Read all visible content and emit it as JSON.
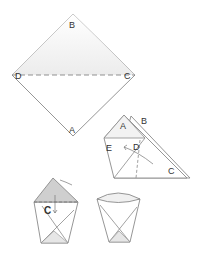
{
  "diagram": {
    "type": "origami-instructions",
    "steps": [
      {
        "name": "step-1-square",
        "labels": {
          "top": "B",
          "left": "D",
          "right": "C",
          "bottom": "A"
        },
        "fold_line": "D-C dashed"
      },
      {
        "name": "step-2-fold-corner",
        "labels": {
          "apex_front": "A",
          "apex_back": "B",
          "left": "E",
          "middle": "D",
          "right": "C"
        }
      },
      {
        "name": "step-3-fold-flap-down",
        "labels": {
          "corner": "C"
        }
      },
      {
        "name": "step-4-finished-cup",
        "labels": {}
      }
    ],
    "colors": {
      "line": "#8a8a8a",
      "shade": "#e6e6e6",
      "dark_shade": "#c8c8c8",
      "text": "#333333"
    }
  }
}
